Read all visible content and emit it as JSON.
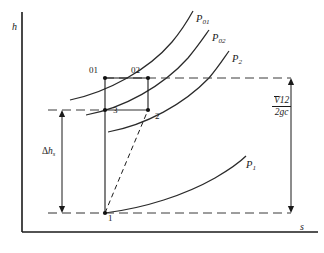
{
  "figure": {
    "kind": "enthalpy-entropy-mollier-diagram",
    "axes": {
      "y_label": "h",
      "x_label": "s",
      "y_axis_x": 22,
      "y_axis_top": 12,
      "x_axis_y": 232,
      "x_axis_right": 318
    },
    "colors": {
      "ink": "#1a1a1a",
      "curve": "#2a2a2a",
      "background": "#ffffff"
    }
  },
  "isobars": [
    {
      "id": "P01",
      "label_main": "P",
      "label_sub": "01",
      "label_x": 196,
      "label_y": 14
    },
    {
      "id": "P02",
      "label_main": "P",
      "label_sub": "02",
      "label_x": 212,
      "label_y": 33
    },
    {
      "id": "P2",
      "label_main": "P",
      "label_sub": "2",
      "label_x": 232,
      "label_y": 54
    },
    {
      "id": "P1",
      "label_main": "P",
      "label_sub": "1",
      "label_x": 246,
      "label_y": 160
    }
  ],
  "state_points": [
    {
      "id": "01",
      "label": "01",
      "x": 105,
      "y": 78,
      "label_x": 89,
      "label_y": 66
    },
    {
      "id": "02",
      "label": "02",
      "x": 148,
      "y": 78,
      "label_x": 131,
      "label_y": 66
    },
    {
      "id": "3",
      "label": "3",
      "x": 105,
      "y": 110,
      "label_x": 113,
      "label_y": 106
    },
    {
      "id": "2",
      "label": "2",
      "x": 148,
      "y": 110,
      "label_x": 155,
      "label_y": 112
    },
    {
      "id": "1",
      "label": "1",
      "x": 105,
      "y": 213,
      "label_x": 108,
      "label_y": 214
    }
  ],
  "annotations": {
    "delta_h": {
      "main": "h",
      "prefix": "Δ",
      "sub": "s",
      "label_x": 42,
      "label_y": 152,
      "arrow_x": 62,
      "arrow_top": 110,
      "arrow_bottom": 213
    },
    "velocity_head": {
      "numerator_symbol": "V",
      "numerator_sub": "1",
      "numerator_sup": "2",
      "denominator": "2g",
      "denominator_sub": "c",
      "label_x": 277,
      "label_y": 104,
      "arrow_x": 291,
      "arrow_top": 78,
      "arrow_bottom": 213
    }
  },
  "guide_lines": [
    {
      "id": "upper-dashed",
      "y": 78,
      "x_start": 105,
      "x_end": 291
    },
    {
      "id": "mid-dashed",
      "y": 110,
      "x_start": 48,
      "x_end": 105
    },
    {
      "id": "lower-dashed",
      "y": 213,
      "x_start": 105,
      "x_end": 291
    }
  ],
  "process_line": {
    "id": "actual-expansion-1-to-2",
    "style": "dashed",
    "from": "1",
    "to": "2"
  }
}
